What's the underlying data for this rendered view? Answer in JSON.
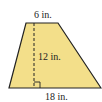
{
  "figure": {
    "shape": "trapezoid",
    "fill_color": "#f3df8a",
    "stroke_color": "#222222",
    "labels": {
      "top_base": "6 in.",
      "height": "12 in.",
      "bottom_base": "18 in."
    },
    "markers": [
      "height-dashed-line",
      "right-angle-marker"
    ]
  }
}
